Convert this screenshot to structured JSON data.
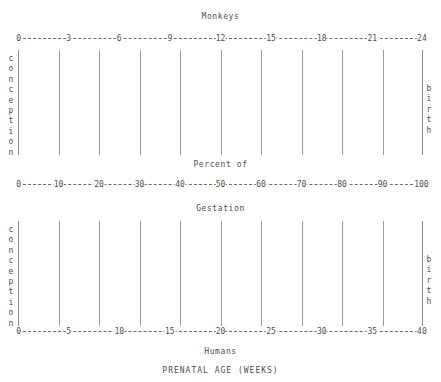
{
  "figure": {
    "caption": "PRENATAL AGE (WEEKS)",
    "top_title": "Monkeys",
    "middle_title_upper": "Percent of",
    "middle_title_lower": "Gestation",
    "bottom_title": "Humans",
    "left_marker": "conception",
    "right_marker": "birth"
  },
  "markers": {
    "conception_letters": [
      "c",
      "o",
      "n",
      "c",
      "e",
      "p",
      "t",
      "i",
      "o",
      "n"
    ],
    "birth_letters": [
      "b",
      "i",
      "r",
      "t",
      "h"
    ]
  },
  "chart_data": {
    "type": "line",
    "title": "PRENATAL AGE (WEEKS)",
    "subtitle": "Percent of Gestation",
    "grid": true,
    "gridline_percent_positions": [
      10,
      20,
      30,
      40,
      50,
      60,
      70,
      80,
      90
    ],
    "axes": [
      {
        "name": "monkeys-axis",
        "label": "Monkeys",
        "position": "top",
        "unit": "weeks",
        "range": [
          0,
          24
        ],
        "tick_step": 3,
        "ticks": [
          "0",
          "3",
          "6",
          "9",
          "12",
          "15",
          "18",
          "21",
          "24"
        ],
        "tick_values": [
          0,
          3,
          6,
          9,
          12,
          15,
          18,
          21,
          24
        ],
        "start_marker": "conception",
        "end_marker": "birth"
      },
      {
        "name": "percent-gestation-axis",
        "label": "Percent of Gestation",
        "position": "middle",
        "unit": "percent",
        "range": [
          0,
          100
        ],
        "tick_step": 10,
        "ticks": [
          "0",
          "10",
          "20",
          "30",
          "40",
          "50",
          "60",
          "70",
          "80",
          "90",
          "100"
        ],
        "tick_values": [
          0,
          10,
          20,
          30,
          40,
          50,
          60,
          70,
          80,
          90,
          100
        ],
        "start_marker": "conception",
        "end_marker": "birth"
      },
      {
        "name": "humans-axis",
        "label": "Humans",
        "position": "bottom",
        "unit": "weeks",
        "range": [
          0,
          40
        ],
        "tick_step": 5,
        "ticks": [
          "0",
          "5",
          "10",
          "15",
          "20",
          "25",
          "30",
          "35",
          "40"
        ],
        "tick_values": [
          0,
          5,
          10,
          15,
          20,
          25,
          30,
          35,
          40
        ],
        "start_marker": "conception",
        "end_marker": "birth"
      }
    ],
    "xlabel": "PRENATAL AGE (WEEKS)",
    "ylabel": "",
    "series": []
  }
}
